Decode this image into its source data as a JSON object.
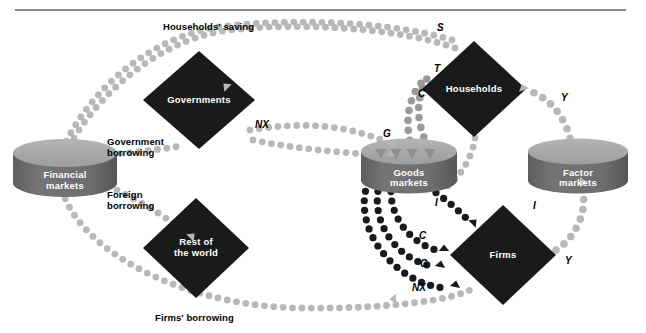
{
  "figure": {
    "type": "circular-flow-diagram",
    "top_rule": true
  },
  "nodes": [
    {
      "id": "financial-markets",
      "shape": "cylinder",
      "label": "Financial\nmarkets",
      "cx": 65,
      "cy": 168,
      "rx": 52,
      "ry": 14,
      "h": 30,
      "fill": "#6b6b6b",
      "top_fill": "#a8a8a8"
    },
    {
      "id": "goods-markets",
      "shape": "cylinder",
      "label": "Goods\nmarkets",
      "cx": 409,
      "cy": 166,
      "rx": 48,
      "ry": 13,
      "h": 29,
      "fill": "#6b6b6b",
      "top_fill": "#a8a8a8"
    },
    {
      "id": "factor-markets",
      "shape": "cylinder",
      "label": "Factor\nmarkets",
      "cx": 578,
      "cy": 166,
      "rx": 50,
      "ry": 13,
      "h": 29,
      "fill": "#6b6b6b",
      "top_fill": "#a8a8a8"
    },
    {
      "id": "governments",
      "shape": "diamond",
      "label": "Governments",
      "cx": 199,
      "cy": 100,
      "rx": 56,
      "ry": 49,
      "fill": "#1a1a1a"
    },
    {
      "id": "households",
      "shape": "diamond",
      "label": "Households",
      "cx": 474,
      "cy": 89,
      "rx": 52,
      "ry": 48,
      "fill": "#1a1a1a"
    },
    {
      "id": "rest-of-the-world",
      "shape": "diamond",
      "label": "Rest of\nthe world",
      "cx": 196,
      "cy": 248,
      "rx": 53,
      "ry": 50,
      "fill": "#1a1a1a"
    },
    {
      "id": "firms",
      "shape": "diamond",
      "label": "Firms",
      "cx": 503,
      "cy": 255,
      "rx": 53,
      "ry": 50,
      "fill": "#1a1a1a"
    }
  ],
  "flow_labels": [
    {
      "id": "households-saving",
      "text": "Households' saving",
      "x": 163,
      "y": 22,
      "kind": "flow"
    },
    {
      "id": "government-borrowing",
      "text": "Government\nborrowing",
      "x": 107,
      "y": 137,
      "kind": "flow"
    },
    {
      "id": "foreign-borrowing",
      "text": "Foreign\nborrowing",
      "x": 107,
      "y": 190,
      "kind": "flow"
    },
    {
      "id": "firms-borrowing",
      "text": "Firms' borrowing",
      "x": 155,
      "y": 313,
      "kind": "flow"
    },
    {
      "id": "sym-S",
      "text": "S",
      "x": 437,
      "y": 22,
      "kind": "symbol"
    },
    {
      "id": "sym-T",
      "text": "T",
      "x": 434,
      "y": 63,
      "kind": "symbol"
    },
    {
      "id": "sym-C-top",
      "text": "C",
      "x": 418,
      "y": 88,
      "kind": "symbol"
    },
    {
      "id": "sym-G-left",
      "text": "G",
      "x": 383,
      "y": 128,
      "kind": "symbol"
    },
    {
      "id": "sym-NX-top",
      "text": "NX",
      "x": 255,
      "y": 119,
      "kind": "symbol"
    },
    {
      "id": "sym-Y-top",
      "text": "Y",
      "x": 561,
      "y": 92,
      "kind": "symbol"
    },
    {
      "id": "sym-Y-bottom",
      "text": "Y",
      "x": 565,
      "y": 255,
      "kind": "symbol"
    },
    {
      "id": "sym-I-left",
      "text": "I",
      "x": 435,
      "y": 197,
      "kind": "symbol"
    },
    {
      "id": "sym-I-right",
      "text": "I",
      "x": 533,
      "y": 200,
      "kind": "symbol"
    },
    {
      "id": "sym-C-bottom",
      "text": "C",
      "x": 419,
      "y": 230,
      "kind": "symbol"
    },
    {
      "id": "sym-G-bottom",
      "text": "G",
      "x": 420,
      "y": 258,
      "kind": "symbol"
    },
    {
      "id": "sym-NX-bottom",
      "text": "NX",
      "x": 412,
      "y": 282,
      "kind": "symbol"
    }
  ],
  "colors": {
    "dot_light": "#b8b8b8",
    "dot_mid": "#8f8f8f",
    "dot_dark": "#1a1a1a",
    "node_dark": "#1a1a1a",
    "cyl_body": "#6b6b6b",
    "cyl_top": "#a8a8a8",
    "rule": "#8a8a8a",
    "text": "#000000",
    "node_text": "#ffffff"
  },
  "paths": [
    {
      "id": "path-households-saving",
      "label": "Households' saving",
      "d": "M 455 48 C 400 28 300 22 230 30 C 160 38 95 95 66 152",
      "color": "#b8b8b8",
      "r": 3.4,
      "gap": 9.4,
      "arrow": {
        "x": 228,
        "y": 88,
        "rot": 225
      }
    },
    {
      "id": "path-S-to-financial",
      "label": "S",
      "d": "M 452 40 C 392 22 300 18 226 26 C 150 34 88 92 62 150",
      "color": "#b8b8b8",
      "r": 3.4,
      "gap": 9.4,
      "arrow": null
    },
    {
      "id": "path-government-borrowing",
      "label": "Government borrowing",
      "d": "M 92 156 C 118 154 160 150 180 146",
      "color": "#b8b8b8",
      "r": 3.4,
      "gap": 9.4,
      "arrow": null
    },
    {
      "id": "path-gov-to-goods",
      "label": "G",
      "d": "M 250 130 C 300 122 340 124 382 140",
      "color": "#b8b8b8",
      "r": 3.4,
      "gap": 9.4,
      "arrow": {
        "x": 391,
        "y": 146,
        "rot": 300
      }
    },
    {
      "id": "path-NX-top",
      "label": "NX",
      "d": "M 253 140 C 300 150 345 152 384 156",
      "color": "#b8b8b8",
      "r": 3.4,
      "gap": 9.4,
      "arrow": {
        "x": 392,
        "y": 156,
        "rot": 270
      }
    },
    {
      "id": "path-foreign-borrowing",
      "label": "Foreign borrowing",
      "d": "M 100 182 C 130 196 160 212 182 230",
      "color": "#b8b8b8",
      "r": 3.4,
      "gap": 9.4,
      "arrow": {
        "x": 190,
        "y": 238,
        "rot": 315
      }
    },
    {
      "id": "path-firms-borrowing",
      "label": "Firms' borrowing",
      "d": "M 62 190 C 80 250 180 306 300 308 C 390 309 450 300 470 290",
      "color": "#b8b8b8",
      "r": 3.4,
      "gap": 9.4,
      "arrow": {
        "x": 396,
        "y": 299,
        "rot": 180
      }
    },
    {
      "id": "path-T",
      "label": "T",
      "d": "M 428 146 C 414 120 416 90 432 72",
      "color": "#9a9a9a",
      "r": 3.8,
      "gap": 10,
      "arrow": null
    },
    {
      "id": "path-C-up",
      "label": "C",
      "d": "M 412 150 C 404 122 408 96 424 80",
      "color": "#9a9a9a",
      "r": 3.8,
      "gap": 10,
      "arrow": null
    },
    {
      "id": "path-Y-households",
      "label": "Y",
      "d": "M 572 148 C 568 120 552 100 532 92",
      "color": "#b8b8b8",
      "r": 3.8,
      "gap": 10,
      "arrow": {
        "x": 524,
        "y": 90,
        "rot": 250
      }
    },
    {
      "id": "path-Y-firms",
      "label": "Y",
      "d": "M 556 250 C 578 236 588 208 582 188",
      "color": "#b8b8b8",
      "r": 3.8,
      "gap": 10,
      "arrow": {
        "x": 580,
        "y": 182,
        "rot": 0
      }
    },
    {
      "id": "path-I-to-firms",
      "label": "I",
      "d": "M 420 182 C 436 192 452 204 466 218",
      "color": "#1a1a1a",
      "r": 3.6,
      "gap": 9.6,
      "arrow": {
        "x": 472,
        "y": 224,
        "rot": 315
      }
    },
    {
      "id": "path-C-to-firms",
      "label": "C",
      "d": "M 392 182 C 386 212 408 242 436 250",
      "color": "#1a1a1a",
      "r": 3.6,
      "gap": 9.6,
      "arrow": {
        "x": 444,
        "y": 251,
        "rot": 270
      }
    },
    {
      "id": "path-G-to-firms",
      "label": "G",
      "d": "M 380 182 C 368 222 398 260 432 266",
      "color": "#1a1a1a",
      "r": 3.6,
      "gap": 9.6,
      "arrow": {
        "x": 440,
        "y": 267,
        "rot": 280
      }
    },
    {
      "id": "path-NX-to-firms",
      "label": "NX",
      "d": "M 368 182 C 350 232 400 286 446 288",
      "color": "#1a1a1a",
      "r": 3.6,
      "gap": 9.6,
      "arrow": {
        "x": 455,
        "y": 287,
        "rot": 280
      }
    },
    {
      "id": "path-goods-in-1",
      "label": "",
      "d": "M 448 186 C 468 170 486 130 468 114",
      "color": "#b8b8b8",
      "r": 3.4,
      "gap": 9.4,
      "arrow": null
    }
  ],
  "goods_inflow_arrows": [
    {
      "x": 381,
      "y": 154,
      "rot": 180
    },
    {
      "x": 396,
      "y": 154,
      "rot": 180
    },
    {
      "x": 412,
      "y": 154,
      "rot": 180
    },
    {
      "x": 430,
      "y": 154,
      "rot": 180
    }
  ]
}
